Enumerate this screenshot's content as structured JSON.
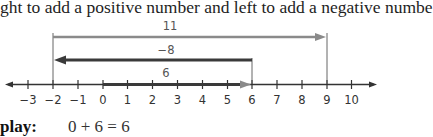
{
  "intro_text": "ght to add a positive number and left to add a negative numbe",
  "number_line": {
    "min": -3,
    "max": 10,
    "tick_labels": [
      "−3",
      "−2",
      "−1",
      "0",
      "1",
      "2",
      "3",
      "4",
      "5",
      "6",
      "7",
      "8",
      "9",
      "10"
    ],
    "arrows": [
      {
        "label": "11",
        "from": -2,
        "to": 9,
        "direction": "right",
        "color": "#8a8a8a"
      },
      {
        "label": "−8",
        "from": 6,
        "to": -2,
        "direction": "left",
        "color": "#3a3a3a"
      },
      {
        "label": "6",
        "from": 0,
        "to": 6,
        "direction": "right",
        "color": "#3a3a3a"
      }
    ]
  },
  "display": {
    "label": "play:",
    "equation": "0 + 6 = 6"
  }
}
